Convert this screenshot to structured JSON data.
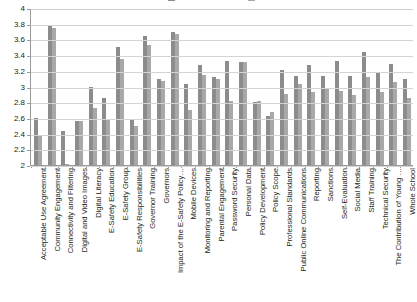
{
  "chart_data": {
    "type": "bar",
    "title": "",
    "xlabel": "",
    "ylabel": "",
    "ylim": [
      2,
      4
    ],
    "ytick_step": 0.2,
    "yticks": [
      "4",
      "3.8",
      "3.6",
      "3.4",
      "3.2",
      "3",
      "2.8",
      "2.6",
      "2.4",
      "2.2",
      "2"
    ],
    "grid": true,
    "legend_position": "top",
    "legend_visible_partial": true,
    "colors": {
      "series1": "#8c8c8c",
      "series2": "#a8a8a8"
    },
    "categories": [
      "Acceptable Use Agreement",
      "Community Engagement",
      "Connectivity and Filtering",
      "Digital and Video Images",
      "Digital Literacy",
      "E-Safety Education",
      "E-Safety Group",
      "E-Safety Responsibilities",
      "Governor Training",
      "Governors",
      "Impact of the E-Safety Policy…",
      "Mobile Devices",
      "Monitoring and Reporting",
      "Parental Engagement",
      "Password Security",
      "Personal Data",
      "Policy Development",
      "Policy Scope",
      "Professional Standards",
      "Public Online Communications",
      "Reporting",
      "Sanctions",
      "Self-Evaluation",
      "Social Media",
      "Staff Training",
      "Technical Security",
      "The Contribution of Young …",
      "Whole School"
    ],
    "series": [
      {
        "name": "Series 1",
        "values": [
          2.6,
          3.79,
          2.43,
          2.56,
          2.99,
          2.85,
          3.5,
          2.57,
          3.64,
          3.09,
          3.7,
          3.03,
          3.28,
          3.12,
          3.33,
          3.31,
          2.8,
          2.63,
          3.21,
          3.14,
          3.27,
          3.13,
          3.33,
          3.13,
          3.44,
          3.18,
          3.29,
          3.1
        ]
      },
      {
        "name": "Series 2",
        "values": [
          2.38,
          3.75,
          2.01,
          2.56,
          2.72,
          2.59,
          3.35,
          2.5,
          3.53,
          3.07,
          3.67,
          2.7,
          3.15,
          3.1,
          2.82,
          3.31,
          2.81,
          2.68,
          2.91,
          3.03,
          2.93,
          2.98,
          2.94,
          2.89,
          3.12,
          2.93,
          3.06,
          2.85
        ]
      }
    ]
  }
}
